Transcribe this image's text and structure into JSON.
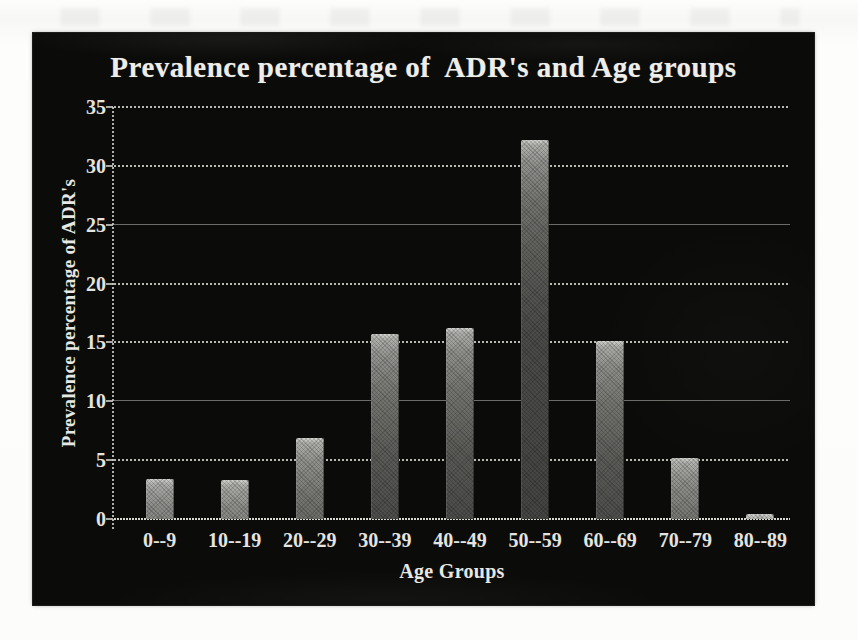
{
  "page": {
    "background": "#fcfcfb",
    "panel_background": "#0b0b0a"
  },
  "colors": {
    "text": "#e7e7e3",
    "gridline_dotted": "#d8d8d2",
    "gridline_solid": "#bebeb9",
    "bar_light": "#d2d2cf",
    "bar_dark": "#444442",
    "axis": "#cdcdc8"
  },
  "chart_data": {
    "type": "bar",
    "title": "Prevalence percentage of  ADR's and Age groups",
    "xlabel": "Age Groups",
    "ylabel": "Prevalence percentage of ADR's",
    "categories": [
      "0--9",
      "10--19",
      "20--29",
      "30--39",
      "40--49",
      "50--59",
      "60--69",
      "70--79",
      "80--89"
    ],
    "values": [
      3.4,
      3.3,
      6.9,
      15.7,
      16.2,
      32.2,
      15.1,
      5.2,
      0.4
    ],
    "ylim": [
      0,
      35
    ],
    "yticks": [
      0,
      5,
      10,
      15,
      20,
      25,
      30,
      35
    ],
    "grid": "horizontal-dotted",
    "legend": "none",
    "bar_style": "gray-gradient-halftone"
  }
}
